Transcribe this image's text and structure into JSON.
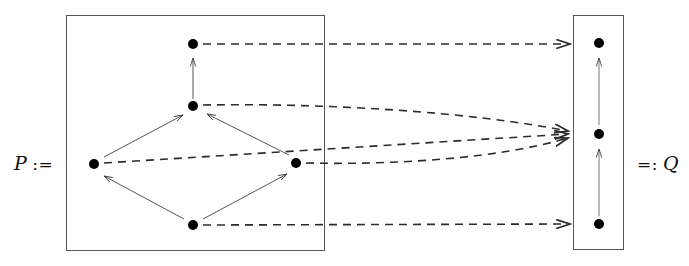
{
  "diagram": {
    "background_color": "#ffffff",
    "stroke_color": "#3a3a3a",
    "node_color": "#000000",
    "labels": {
      "left": {
        "symbol": "P",
        "operator": ":=",
        "full": "P :="
      },
      "right": {
        "symbol": "Q",
        "operator": "=:",
        "full": "=: Q"
      }
    },
    "boxes": [
      {
        "name": "source-box",
        "x": 66,
        "y": 15,
        "width": 259,
        "height": 236
      },
      {
        "name": "target-box",
        "x": 573,
        "y": 15,
        "width": 51,
        "height": 235
      }
    ],
    "source_nodes": [
      {
        "id": "p-top",
        "x": 193,
        "y": 44,
        "r": 5
      },
      {
        "id": "p-upper",
        "x": 193,
        "y": 106,
        "r": 5
      },
      {
        "id": "p-left",
        "x": 94,
        "y": 164,
        "r": 5
      },
      {
        "id": "p-right",
        "x": 296,
        "y": 163,
        "r": 5
      },
      {
        "id": "p-bottom",
        "x": 193,
        "y": 225,
        "r": 5
      }
    ],
    "target_nodes": [
      {
        "id": "q-top",
        "x": 599,
        "y": 43,
        "r": 5
      },
      {
        "id": "q-mid",
        "x": 599,
        "y": 134,
        "r": 5
      },
      {
        "id": "q-bottom",
        "x": 599,
        "y": 224,
        "r": 5
      }
    ],
    "source_edges": [
      {
        "from": "p-upper",
        "to": "p-top",
        "style": "solid"
      },
      {
        "from": "p-left",
        "to": "p-upper",
        "style": "solid"
      },
      {
        "from": "p-right",
        "to": "p-upper",
        "style": "solid"
      },
      {
        "from": "p-bottom",
        "to": "p-left",
        "style": "solid"
      },
      {
        "from": "p-bottom",
        "to": "p-right",
        "style": "solid"
      }
    ],
    "target_edges": [
      {
        "from": "q-mid",
        "to": "q-top",
        "style": "solid"
      },
      {
        "from": "q-bottom",
        "to": "q-mid",
        "style": "solid"
      }
    ],
    "map_edges": [
      {
        "from": "p-top",
        "to": "q-top",
        "style": "dashed",
        "curved": false
      },
      {
        "from": "p-upper",
        "to": "q-mid",
        "style": "dashed",
        "curved": true
      },
      {
        "from": "p-left",
        "to": "q-mid",
        "style": "dashed",
        "curved": false
      },
      {
        "from": "p-right",
        "to": "q-mid",
        "style": "dashed",
        "curved": true
      },
      {
        "from": "p-bottom",
        "to": "q-bottom",
        "style": "dashed",
        "curved": false
      }
    ]
  }
}
